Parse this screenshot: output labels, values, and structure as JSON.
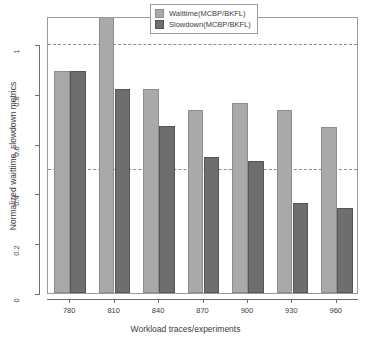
{
  "chart_data": {
    "type": "bar",
    "title": "",
    "xlabel": "Workload traces/experiments",
    "ylabel": "Normalized waittime, slowdown metrics",
    "categories": [
      "780",
      "810",
      "840",
      "870",
      "900",
      "930",
      "960"
    ],
    "series": [
      {
        "name": "Waittime(MCBP/BKFL)",
        "color": "#a9a9a9",
        "values": [
          0.89,
          1.16,
          0.82,
          0.735,
          0.765,
          0.735,
          0.665
        ]
      },
      {
        "name": "Slowdown(MCBP/BKFL)",
        "color": "#6e6e6e",
        "values": [
          0.89,
          0.82,
          0.67,
          0.545,
          0.53,
          0.36,
          0.34
        ]
      }
    ],
    "ylim": [
      0,
      1.115
    ],
    "yticks": [
      "0",
      "0.2",
      "0.4",
      "0.6",
      "0.8",
      "1"
    ],
    "ytick_values": [
      0,
      0.2,
      0.4,
      0.6,
      0.8,
      1
    ],
    "reference_lines": [
      0.5,
      1.0
    ],
    "grid": "horizontal-dashed-at-reference-lines",
    "legend_position": "top-center",
    "note_810_waittime_clipped": "bar exceeds plot top and is visually clipped"
  },
  "legend": {
    "entries": [
      {
        "label": "Waittime(MCBP/BKFL)",
        "swatch": "light-grey-square"
      },
      {
        "label": "Slowdown(MCBP/BKFL)",
        "swatch": "dark-grey-square"
      }
    ]
  },
  "axes": {
    "x_title": "Workload traces/experiments",
    "y_title": "Normalized waittime, slowdown metrics"
  }
}
